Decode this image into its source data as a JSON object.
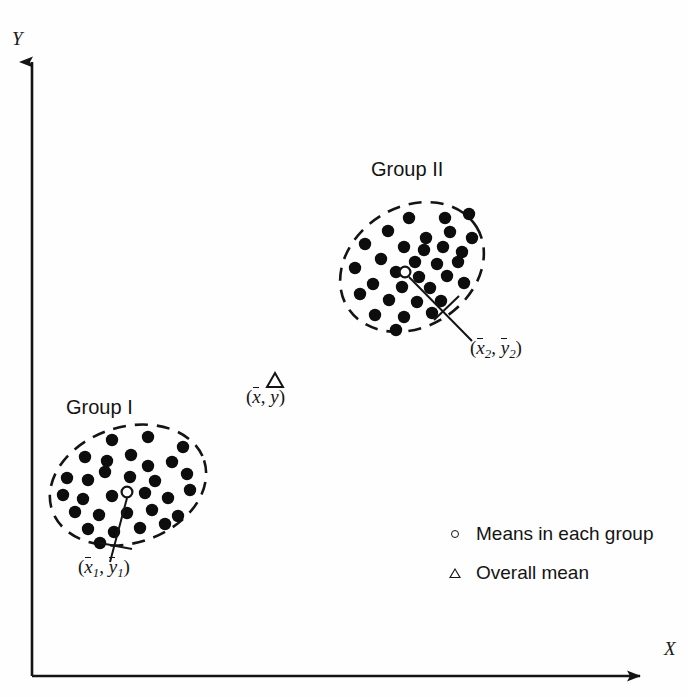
{
  "figure": {
    "background_color": "#fefefe",
    "ink_color": "#141414"
  },
  "axes": {
    "y_label": "Y",
    "x_label": "X",
    "origin": {
      "x": 32,
      "y": 676
    },
    "y_top": 52,
    "x_right": 652
  },
  "groups": [
    {
      "id": "group-1",
      "title": "Group I",
      "mean_marker": {
        "x": 127,
        "y": 492,
        "type": "open-circle"
      },
      "mean_label": {
        "x_text": "x",
        "x_sub": "1",
        "y_text": "y",
        "y_sub": "1"
      },
      "ellipse": {
        "cx": 128,
        "cy": 485,
        "rx": 80,
        "ry": 58,
        "rotation": -18
      },
      "points": [
        [
          112,
          440
        ],
        [
          148,
          437
        ],
        [
          183,
          447
        ],
        [
          85,
          457
        ],
        [
          107,
          461
        ],
        [
          131,
          455
        ],
        [
          105,
          472
        ],
        [
          148,
          466
        ],
        [
          172,
          462
        ],
        [
          67,
          478
        ],
        [
          88,
          480
        ],
        [
          130,
          477
        ],
        [
          155,
          481
        ],
        [
          187,
          474
        ],
        [
          63,
          495
        ],
        [
          83,
          499
        ],
        [
          112,
          496
        ],
        [
          145,
          493
        ],
        [
          168,
          498
        ],
        [
          190,
          490
        ],
        [
          75,
          512
        ],
        [
          99,
          515
        ],
        [
          127,
          513
        ],
        [
          152,
          510
        ],
        [
          178,
          516
        ],
        [
          88,
          529
        ],
        [
          114,
          532
        ],
        [
          140,
          528
        ],
        [
          165,
          524
        ],
        [
          100,
          543
        ]
      ]
    },
    {
      "id": "group-2",
      "title": "Group II",
      "mean_marker": {
        "x": 405,
        "y": 272,
        "type": "open-circle"
      },
      "mean_label": {
        "x_text": "x",
        "x_sub": "2",
        "y_text": "y",
        "y_sub": "2"
      },
      "ellipse": {
        "cx": 412,
        "cy": 267,
        "rx": 76,
        "ry": 60,
        "rotation": -32
      },
      "points": [
        [
          409,
          218
        ],
        [
          445,
          218
        ],
        [
          469,
          214
        ],
        [
          388,
          231
        ],
        [
          426,
          238
        ],
        [
          450,
          232
        ],
        [
          472,
          238
        ],
        [
          365,
          244
        ],
        [
          404,
          247
        ],
        [
          424,
          250
        ],
        [
          443,
          247
        ],
        [
          462,
          252
        ],
        [
          381,
          259
        ],
        [
          415,
          262
        ],
        [
          437,
          264
        ],
        [
          458,
          262
        ],
        [
          355,
          268
        ],
        [
          396,
          272
        ],
        [
          419,
          277
        ],
        [
          447,
          276
        ],
        [
          373,
          284
        ],
        [
          402,
          287
        ],
        [
          430,
          288
        ],
        [
          464,
          283
        ],
        [
          360,
          294
        ],
        [
          389,
          300
        ],
        [
          417,
          302
        ],
        [
          441,
          301
        ],
        [
          375,
          315
        ],
        [
          404,
          317
        ],
        [
          432,
          313
        ],
        [
          396,
          330
        ]
      ]
    }
  ],
  "overall_mean": {
    "marker": {
      "x": 275,
      "y": 381,
      "type": "open-triangle"
    },
    "label": {
      "x_text": "x",
      "y_text": "y"
    }
  },
  "legend": {
    "entries": [
      {
        "marker": "open-circle",
        "label": "Means in each group"
      },
      {
        "marker": "open-triangle",
        "label": "Overall mean"
      }
    ]
  }
}
